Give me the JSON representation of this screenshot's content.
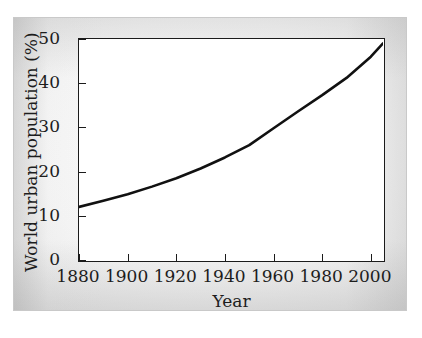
{
  "chart_data": {
    "type": "line",
    "title": "",
    "xlabel": "Year",
    "ylabel": "World urban population (%)",
    "xlim": [
      1880,
      2005
    ],
    "ylim": [
      0,
      50
    ],
    "xticks": [
      1880,
      1900,
      1920,
      1940,
      1960,
      1980,
      2000
    ],
    "xtick_labels": [
      "1880",
      "1900",
      "1920",
      "1940",
      "1960",
      "1980",
      "2000"
    ],
    "yticks": [
      0,
      10,
      20,
      30,
      40,
      50
    ],
    "ytick_labels": [
      "0",
      "10",
      "20",
      "30",
      "40",
      "50"
    ],
    "grid": false,
    "legend": null,
    "series": [
      {
        "name": "World urban population",
        "color": "#111111",
        "line_width": 2.6,
        "x": [
          1880,
          1890,
          1900,
          1910,
          1920,
          1930,
          1940,
          1950,
          1960,
          1970,
          1980,
          1990,
          2000,
          2005
        ],
        "values": [
          12.0,
          13.4,
          14.9,
          16.6,
          18.5,
          20.7,
          23.2,
          26.0,
          29.8,
          33.6,
          37.3,
          41.2,
          46.0,
          49.0
        ]
      }
    ]
  }
}
